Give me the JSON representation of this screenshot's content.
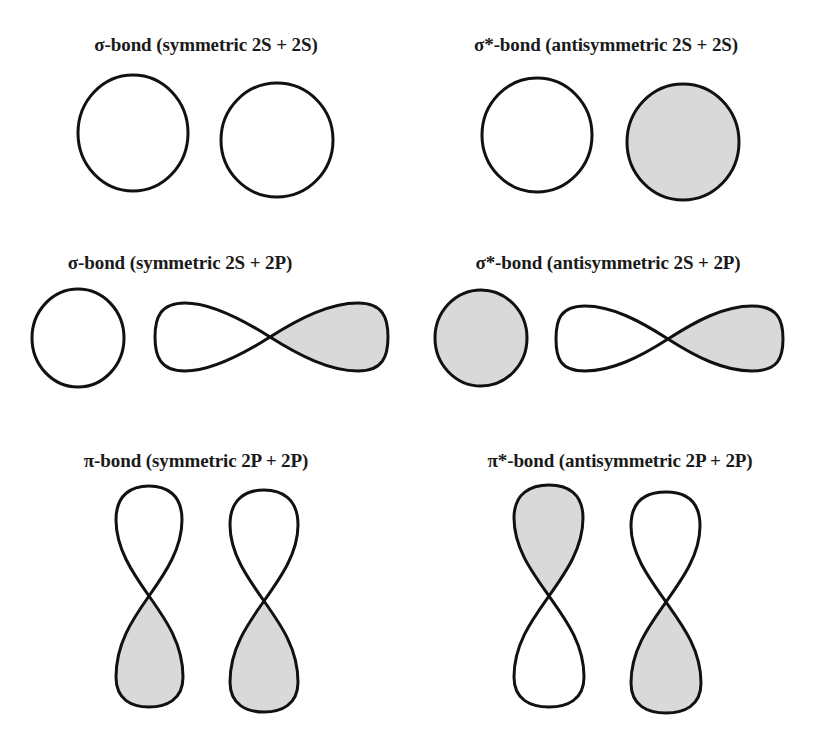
{
  "colors": {
    "stroke": "#111111",
    "shaded": "#d9d9d9",
    "unshaded": "#ffffff",
    "background": "#ffffff"
  },
  "panels": [
    {
      "id": "sigma-2s-2s",
      "title": "σ-bond (symmetric 2S + 2S)",
      "orbitals": [
        {
          "type": "s",
          "phase": "unshaded"
        },
        {
          "type": "s",
          "phase": "unshaded"
        }
      ]
    },
    {
      "id": "sigma-star-2s-2s",
      "title": "σ*-bond (antisymmetric 2S + 2S)",
      "orbitals": [
        {
          "type": "s",
          "phase": "unshaded"
        },
        {
          "type": "s",
          "phase": "shaded"
        }
      ]
    },
    {
      "id": "sigma-2s-2p",
      "title": "σ-bond (symmetric 2S + 2P)",
      "orbitals": [
        {
          "type": "s",
          "phase": "unshaded"
        },
        {
          "type": "p-horizontal",
          "left_lobe": "unshaded",
          "right_lobe": "shaded"
        }
      ]
    },
    {
      "id": "sigma-star-2s-2p",
      "title": "σ*-bond (antisymmetric 2S + 2P)",
      "orbitals": [
        {
          "type": "s",
          "phase": "shaded"
        },
        {
          "type": "p-horizontal",
          "left_lobe": "unshaded",
          "right_lobe": "shaded"
        }
      ]
    },
    {
      "id": "pi-2p-2p",
      "title": "π-bond (symmetric 2P + 2P)",
      "orbitals": [
        {
          "type": "p-vertical",
          "top_lobe": "unshaded",
          "bottom_lobe": "shaded"
        },
        {
          "type": "p-vertical",
          "top_lobe": "unshaded",
          "bottom_lobe": "shaded"
        }
      ]
    },
    {
      "id": "pi-star-2p-2p",
      "title": "π*-bond (antisymmetric 2P + 2P)",
      "orbitals": [
        {
          "type": "p-vertical",
          "top_lobe": "shaded",
          "bottom_lobe": "unshaded"
        },
        {
          "type": "p-vertical",
          "top_lobe": "unshaded",
          "bottom_lobe": "shaded"
        }
      ]
    }
  ]
}
